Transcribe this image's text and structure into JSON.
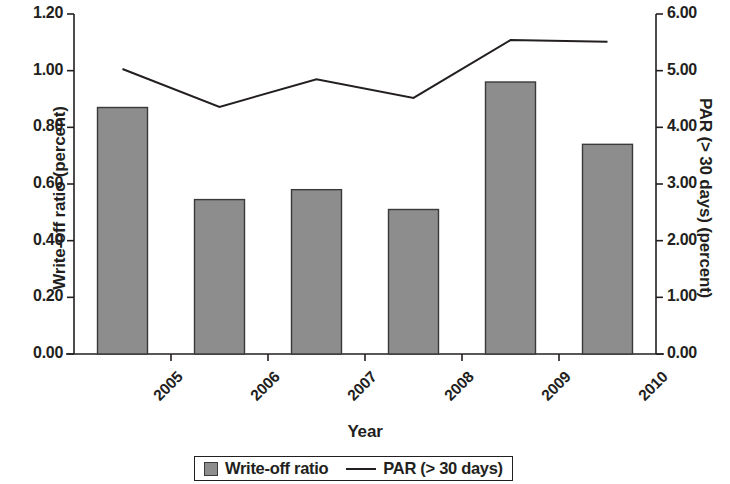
{
  "chart_data": {
    "type": "bar",
    "title": "",
    "subtitle": "",
    "xlabel": "Year",
    "ylabel": "Write-off ratio (percent)",
    "y2label": "PAR (> 30 days) (percent)",
    "categories": [
      "2005",
      "2006",
      "2007",
      "2008",
      "2009",
      "2010"
    ],
    "ylim": [
      0.0,
      1.2
    ],
    "y2lim": [
      0.0,
      6.0
    ],
    "ytick_labels": [
      "0.00",
      "0.20",
      "0.40",
      "0.60",
      "0.80",
      "1.00",
      "1.20"
    ],
    "ytick_values": [
      0.0,
      0.2,
      0.4,
      0.6,
      0.8,
      1.0,
      1.2
    ],
    "y2tick_labels": [
      "0.00",
      "1.00",
      "2.00",
      "3.00",
      "4.00",
      "5.00",
      "6.00"
    ],
    "y2tick_values": [
      0.0,
      1.0,
      2.0,
      3.0,
      4.0,
      5.0,
      6.0
    ],
    "grid": false,
    "legend_position": "bottom",
    "series": [
      {
        "name": "Write-off ratio",
        "type": "bar",
        "axis": "left",
        "color": "#8d8d8d",
        "edge_color": "#3a3a3a",
        "values": [
          0.87,
          0.545,
          0.58,
          0.51,
          0.96,
          0.74
        ]
      },
      {
        "name": "PAR (> 30 days)",
        "type": "line",
        "axis": "right",
        "color": "#231f20",
        "values": [
          5.03,
          4.36,
          4.85,
          4.52,
          5.54,
          5.51
        ]
      }
    ]
  },
  "legend": {
    "items": [
      {
        "label": "Write-off ratio",
        "marker": "bar-swatch"
      },
      {
        "label": "PAR (> 30 days)",
        "marker": "line-swatch"
      }
    ]
  }
}
